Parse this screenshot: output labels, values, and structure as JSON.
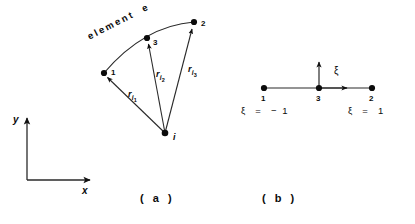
{
  "figure": {
    "panel_a": {
      "element_label": "element  e",
      "nodes": [
        {
          "id": "node-1",
          "label": "1",
          "x": 104,
          "y": 73
        },
        {
          "id": "node-2",
          "label": "2",
          "x": 194,
          "y": 22
        },
        {
          "id": "node-3",
          "label": "3",
          "x": 147,
          "y": 38
        },
        {
          "id": "node-i",
          "label": "i",
          "x": 165,
          "y": 133
        }
      ],
      "vectors": [
        {
          "id": "r-i-1",
          "base": "r",
          "sub": "i",
          "subsub": "1",
          "from": "node-i",
          "to": "node-1"
        },
        {
          "id": "r-i-2",
          "base": "r",
          "sub": "i",
          "subsub": "2",
          "from": "node-i",
          "to": "node-3"
        },
        {
          "id": "r-i-3",
          "base": "r",
          "sub": "i",
          "subsub": "3",
          "from": "node-i",
          "to": "node-2"
        }
      ],
      "axes": {
        "x_label": "x",
        "y_label": "y"
      },
      "caption": "( a )"
    },
    "panel_b": {
      "nodes": [
        {
          "id": "node-b-1",
          "label": "1",
          "x": 264,
          "y": 88
        },
        {
          "id": "node-b-3",
          "label": "3",
          "x": 319,
          "y": 88
        },
        {
          "id": "node-b-2",
          "label": "2",
          "x": 372,
          "y": 88
        }
      ],
      "xi_axis_label": "ξ",
      "xi_left": "ξ  =  − 1",
      "xi_right": "ξ  =  1",
      "caption": "( b )"
    },
    "colors": {
      "ink": "#0b0b0b",
      "line": "#2a2a2a",
      "background": "#ffffff"
    }
  }
}
